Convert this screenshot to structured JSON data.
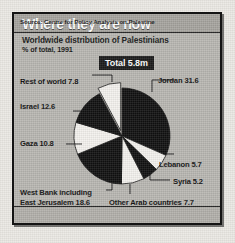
{
  "panel": {
    "title": "Where they are now",
    "subtitle": "Worldwide distribution of Palestinians",
    "units": "% of total, 1991",
    "total_badge": "Total 5.8m",
    "source": "Source: Centre for Policy Analysis on Palestine"
  },
  "labels": {
    "rest_of_world": "Rest of world  7.8",
    "israel": "Israel  12.6",
    "gaza": "Gaza  10.8",
    "west_bank_line1": "West Bank including",
    "west_bank_line2": "East Jerusalem  18.6",
    "jordan": "Jordan  31.6",
    "lebanon": "Lebanon  5.7",
    "syria": "Syria  5.2",
    "other_arab": "Other Arab countries  7.7"
  },
  "colors": {
    "panel_bg": "#b9b7b2",
    "header_bg": "#a6a49f",
    "border": "#141414",
    "slice_dark": "#111111",
    "slice_light": "#f4f2ee",
    "badge_bg": "#1b1b1b",
    "badge_text": "#ffffff"
  },
  "chart_data": {
    "type": "pie",
    "title": "Where they are now",
    "subtitle": "Worldwide distribution of Palestinians",
    "units": "% of total, 1991",
    "total": "5.8m",
    "categories": [
      "Jordan",
      "West Bank including East Jerusalem",
      "Israel",
      "Gaza",
      "Other Arab countries",
      "Rest of world",
      "Lebanon",
      "Syria"
    ],
    "values": [
      31.6,
      18.6,
      12.6,
      10.8,
      7.7,
      7.8,
      5.7,
      5.2
    ],
    "slices": [
      {
        "name": "Jordan",
        "value": 31.6,
        "fill": "#111111",
        "exploded": false
      },
      {
        "name": "Lebanon",
        "value": 5.7,
        "fill": "#f4f2ee",
        "exploded": false
      },
      {
        "name": "Syria",
        "value": 5.2,
        "fill": "#111111",
        "exploded": false
      },
      {
        "name": "Other Arab countries",
        "value": 7.7,
        "fill": "#f4f2ee",
        "exploded": false
      },
      {
        "name": "West Bank including East Jerusalem",
        "value": 18.6,
        "fill": "#111111",
        "exploded": false
      },
      {
        "name": "Gaza",
        "value": 10.8,
        "fill": "#f4f2ee",
        "exploded": false
      },
      {
        "name": "Israel",
        "value": 12.6,
        "fill": "#111111",
        "exploded": false
      },
      {
        "name": "Rest of world",
        "value": 7.8,
        "fill": "#f4f2ee",
        "exploded": true
      }
    ],
    "legend": "labelled with leader lines",
    "grid": false,
    "source": "Source: Centre for Policy Analysis on Palestine"
  }
}
